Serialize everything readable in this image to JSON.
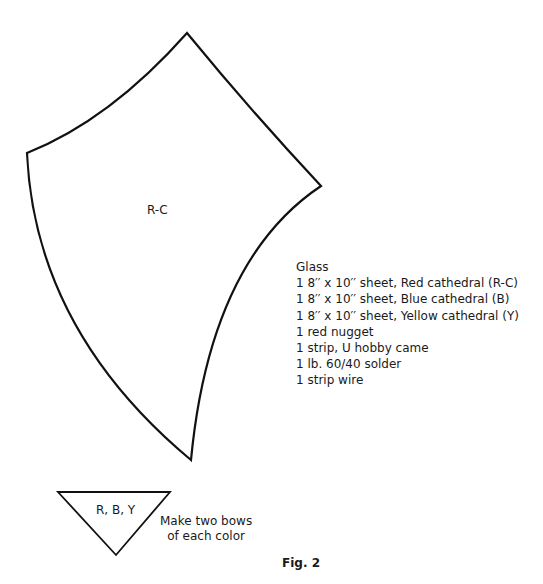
{
  "pattern": {
    "main_piece_label": "R-C",
    "bow_piece_label": "R, B, Y"
  },
  "materials": {
    "heading": "Glass",
    "items": [
      "1 8′′ x 10′′ sheet, Red cathedral (R-C)",
      "1 8′′ x 10′′ sheet, Blue cathedral (B)",
      "1 8′′ x 10′′ sheet, Yellow cathedral (Y)",
      "1 red nugget",
      "1 strip, U hobby came",
      "1 lb. 60/40 solder",
      "1 strip wire"
    ]
  },
  "note": {
    "line1": "Make two bows",
    "line2": "of each color"
  },
  "figure_caption": "Fig. 2"
}
